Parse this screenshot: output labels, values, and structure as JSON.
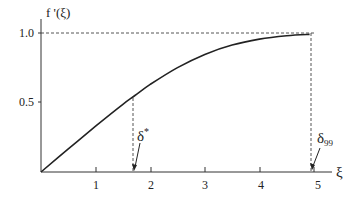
{
  "chart_data": {
    "type": "line",
    "title": "",
    "xlabel": "ξ",
    "ylabel": "f '(ξ)",
    "xlim": [
      0,
      5.3
    ],
    "ylim": [
      0,
      1.0
    ],
    "x_ticks": [
      "1",
      "2",
      "3",
      "4",
      "5"
    ],
    "y_ticks": [
      "0.5",
      "1.0"
    ],
    "grid": false,
    "legend": null,
    "series": [
      {
        "name": "f '(ξ)",
        "x": [
          0,
          0.5,
          1.0,
          1.5,
          1.72,
          2.0,
          2.5,
          3.0,
          3.5,
          4.0,
          4.5,
          4.92
        ],
        "values": [
          0,
          0.166,
          0.33,
          0.487,
          0.55,
          0.63,
          0.751,
          0.846,
          0.913,
          0.956,
          0.98,
          0.99
        ]
      }
    ],
    "reference_lines": [
      {
        "type": "horizontal",
        "y": 1.0,
        "style": "dashed"
      },
      {
        "type": "vertical",
        "x": 1.72,
        "style": "dashed",
        "label": "δ*"
      },
      {
        "type": "vertical",
        "x": 4.92,
        "style": "dashed",
        "label": "δ99"
      }
    ],
    "annotations": [
      {
        "text": "δ*",
        "points_to_x": 1.72
      },
      {
        "text": "δ",
        "subscript": "99",
        "points_to_x": 4.92
      }
    ]
  },
  "labels": {
    "y_axis": "f '(ξ)",
    "x_axis": "ξ",
    "tick_1": "1",
    "tick_2": "2",
    "tick_3": "3",
    "tick_4": "4",
    "tick_5": "5",
    "ytick_05": "0.5",
    "ytick_10": "1.0",
    "delta_star": "δ",
    "delta_star_sup": "*",
    "delta_99": "δ",
    "delta_99_sub": "99"
  }
}
